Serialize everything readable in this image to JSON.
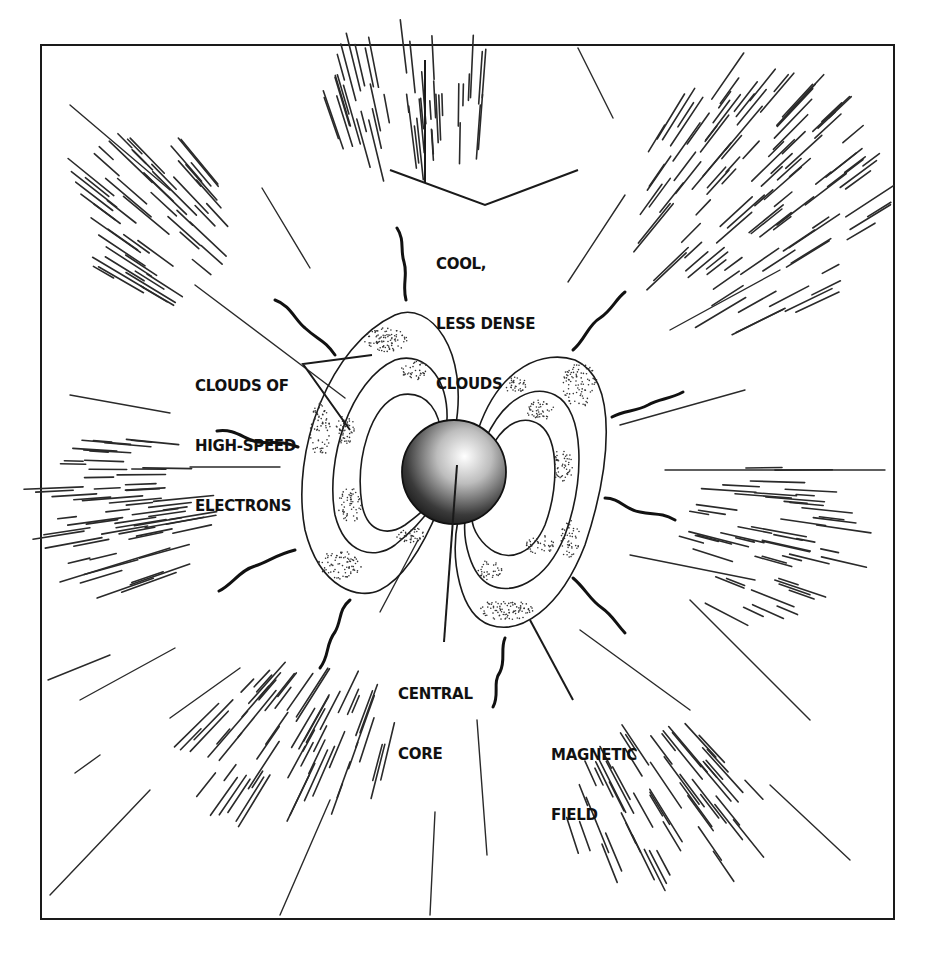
{
  "diagram": {
    "type": "illustration",
    "colors": {
      "ink": "#1a1a1a",
      "background": "#ffffff",
      "stipple": "#333333"
    },
    "labels": {
      "cool_clouds": {
        "line1": "COOL,",
        "line2": "LESS DENSE",
        "line3": "CLOUDS"
      },
      "electrons": {
        "line1": "CLOUDS OF",
        "line2": "HIGH-SPEED",
        "line3": "ELECTRONS"
      },
      "core": {
        "line1": "CENTRAL",
        "line2": "CORE"
      },
      "field": {
        "line1": "MAGNETIC",
        "line2": "FIELD"
      }
    },
    "components": [
      "central-core",
      "magnetic-field-loops",
      "electron-clouds",
      "cool-clouds",
      "radiation-waves"
    ]
  }
}
